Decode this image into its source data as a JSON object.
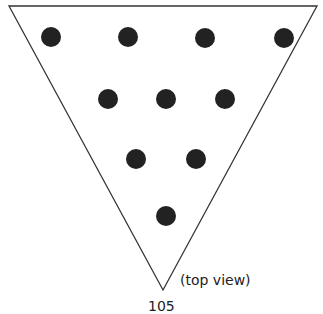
{
  "diagram": {
    "caption": "(top view)",
    "cut_text": "105",
    "triangle": {
      "points": [
        [
          9,
          6
        ],
        [
          317,
          6
        ],
        [
          163,
          290
        ]
      ],
      "stroke": "#333333"
    },
    "dot_color": "#222222",
    "dot_radius": 10,
    "dots": [
      [
        51,
        37
      ],
      [
        128,
        37
      ],
      [
        205,
        38
      ],
      [
        284,
        38
      ],
      [
        108,
        99
      ],
      [
        166,
        99
      ],
      [
        225,
        99
      ],
      [
        136,
        159
      ],
      [
        196,
        159
      ],
      [
        166,
        216
      ]
    ]
  }
}
